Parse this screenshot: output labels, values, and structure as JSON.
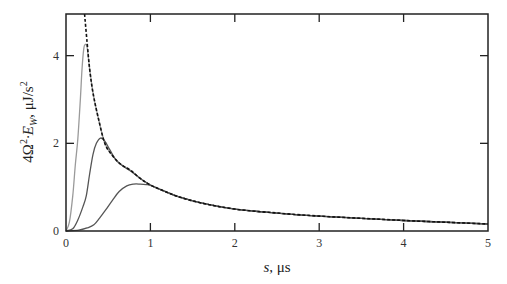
{
  "chart_data": {
    "type": "line",
    "title": "",
    "xlabel": "s, μs",
    "ylabel": "4Ω²·E_W, μJ/s²",
    "ylabel_parts": {
      "prefix": "4Ω",
      "sup1": "2",
      "dot": "·E",
      "sub": "W",
      "unit": ", μJ/s",
      "sup2": "2"
    },
    "xlabel_parts": {
      "var": "s",
      "unit": ", μs"
    },
    "xlim": [
      0,
      5
    ],
    "ylim": [
      0,
      4.95
    ],
    "xticks": [
      0,
      1,
      2,
      3,
      4,
      5
    ],
    "xtick_labels": [
      "0",
      "1",
      "2",
      "3",
      "4",
      "5"
    ],
    "yticks": [
      0,
      2,
      4
    ],
    "ytick_labels": [
      "0",
      "2",
      "4"
    ],
    "grid": false,
    "legend": null,
    "series": [
      {
        "name": "envelope",
        "style": "dashed",
        "color": "#111111",
        "points": [
          [
            0.22,
            4.95
          ],
          [
            0.25,
            4.3
          ],
          [
            0.28,
            3.7
          ],
          [
            0.32,
            3.15
          ],
          [
            0.38,
            2.6
          ],
          [
            0.46,
            2.0
          ],
          [
            0.55,
            1.72
          ],
          [
            0.65,
            1.52
          ],
          [
            0.76,
            1.39
          ],
          [
            0.88,
            1.2
          ],
          [
            1.0,
            1.05
          ],
          [
            1.2,
            0.88
          ],
          [
            1.35,
            0.77
          ],
          [
            1.6,
            0.64
          ],
          [
            2.0,
            0.5
          ],
          [
            2.5,
            0.41
          ],
          [
            3.0,
            0.34
          ],
          [
            3.5,
            0.29
          ],
          [
            4.0,
            0.24
          ],
          [
            4.5,
            0.2
          ],
          [
            5.0,
            0.16
          ]
        ]
      },
      {
        "name": "curve-1",
        "style": "solid",
        "color": "#9a9a9a",
        "points": [
          [
            0.0,
            0.0
          ],
          [
            0.04,
            0.2
          ],
          [
            0.08,
            0.8
          ],
          [
            0.11,
            1.5
          ],
          [
            0.14,
            2.1
          ],
          [
            0.17,
            3.0
          ],
          [
            0.19,
            3.7
          ],
          [
            0.21,
            4.15
          ],
          [
            0.225,
            4.25
          ],
          [
            0.25,
            4.2
          ],
          [
            0.28,
            3.7
          ],
          [
            0.32,
            3.15
          ],
          [
            0.38,
            2.6
          ],
          [
            0.46,
            2.0
          ],
          [
            0.55,
            1.72
          ],
          [
            0.65,
            1.52
          ],
          [
            0.76,
            1.39
          ],
          [
            0.88,
            1.2
          ],
          [
            1.0,
            1.05
          ],
          [
            1.2,
            0.88
          ],
          [
            1.35,
            0.77
          ],
          [
            1.6,
            0.64
          ],
          [
            2.0,
            0.5
          ],
          [
            2.5,
            0.41
          ],
          [
            3.0,
            0.34
          ],
          [
            3.5,
            0.29
          ],
          [
            4.0,
            0.24
          ],
          [
            4.5,
            0.2
          ],
          [
            5.0,
            0.16
          ]
        ]
      },
      {
        "name": "curve-2",
        "style": "solid",
        "color": "#555555",
        "points": [
          [
            0.0,
            0.0
          ],
          [
            0.08,
            0.05
          ],
          [
            0.14,
            0.25
          ],
          [
            0.2,
            0.55
          ],
          [
            0.24,
            0.8
          ],
          [
            0.28,
            1.3
          ],
          [
            0.32,
            1.75
          ],
          [
            0.36,
            2.0
          ],
          [
            0.41,
            2.12
          ],
          [
            0.46,
            2.05
          ],
          [
            0.52,
            1.85
          ],
          [
            0.6,
            1.6
          ],
          [
            0.7,
            1.45
          ],
          [
            0.8,
            1.32
          ],
          [
            0.9,
            1.17
          ],
          [
            1.0,
            1.05
          ],
          [
            1.2,
            0.88
          ],
          [
            1.35,
            0.77
          ],
          [
            1.6,
            0.64
          ],
          [
            2.0,
            0.5
          ],
          [
            2.5,
            0.41
          ],
          [
            3.0,
            0.34
          ],
          [
            3.5,
            0.29
          ],
          [
            4.0,
            0.24
          ],
          [
            4.5,
            0.2
          ],
          [
            5.0,
            0.16
          ]
        ]
      },
      {
        "name": "curve-3",
        "style": "solid",
        "color": "#555555",
        "points": [
          [
            0.0,
            0.0
          ],
          [
            0.15,
            0.02
          ],
          [
            0.25,
            0.07
          ],
          [
            0.33,
            0.14
          ],
          [
            0.4,
            0.3
          ],
          [
            0.47,
            0.48
          ],
          [
            0.55,
            0.7
          ],
          [
            0.63,
            0.9
          ],
          [
            0.72,
            1.03
          ],
          [
            0.8,
            1.07
          ],
          [
            0.88,
            1.07
          ],
          [
            0.95,
            1.06
          ],
          [
            1.0,
            1.04
          ],
          [
            1.2,
            0.88
          ],
          [
            1.35,
            0.77
          ],
          [
            1.6,
            0.64
          ],
          [
            2.0,
            0.5
          ],
          [
            2.5,
            0.41
          ],
          [
            3.0,
            0.34
          ],
          [
            3.5,
            0.29
          ],
          [
            4.0,
            0.24
          ],
          [
            4.5,
            0.2
          ],
          [
            5.0,
            0.16
          ]
        ]
      }
    ]
  },
  "layout": {
    "plot_left": 66,
    "plot_right": 488,
    "plot_top": 14,
    "plot_bottom": 231
  }
}
